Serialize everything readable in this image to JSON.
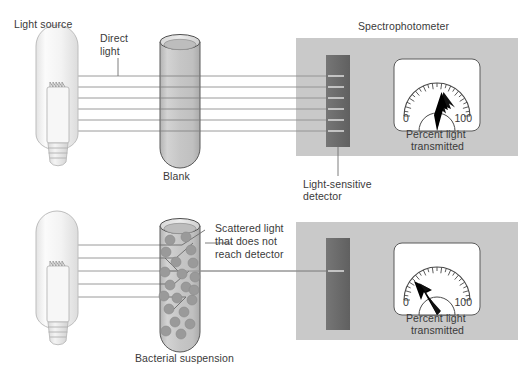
{
  "figure": {
    "title_absent": true,
    "background": "#ffffff",
    "panel_fill": "#c9c9c9",
    "detector_fill": "#6e6e6e",
    "meter_fill": "#ffffff",
    "tube_fill": "#c2c2c2",
    "bulb_fill": "#f2f2f2",
    "cell_fill": "#9a9a9a",
    "ray_color": "#8c8c8c",
    "outline_color": "#555555",
    "text_color": "#3a3a3a"
  },
  "labels": {
    "light_source": "Light source",
    "direct_light": "Direct\nlight",
    "direct_light_line1": "Direct",
    "direct_light_line2": "light",
    "blank": "Blank",
    "spectrophotometer": "Spectrophotometer",
    "light_sensitive_detector_line1": "Light-sensitive",
    "light_sensitive_detector_line2": "detector",
    "scattered_line1": "Scattered light",
    "scattered_line2": "that does not",
    "scattered_line3": "reach detector",
    "bacterial_suspension": "Bacterial suspension"
  },
  "meters": [
    {
      "id": "meter-top",
      "scale_min_label": "0",
      "scale_max_label": "100",
      "caption_line1": "Percent light",
      "caption_line2": "transmitted",
      "needle_reading_percent": 92,
      "needle_angle_deg": -52,
      "tick_count": 23
    },
    {
      "id": "meter-bottom",
      "scale_min_label": "0",
      "scale_max_label": "100",
      "caption_line1": "Percent light",
      "caption_line2": "transmitted",
      "needle_reading_percent": 22,
      "needle_angle_deg": -125,
      "tick_count": 23
    }
  ],
  "panels": [
    {
      "id": "panel-top",
      "name": "blank-measurement",
      "ray_count": 6,
      "rays_reaching_detector": 6,
      "tube_contents": "blank",
      "cell_count": 0
    },
    {
      "id": "panel-bottom",
      "name": "bacterial-suspension-measurement",
      "ray_count": 6,
      "rays_reaching_detector": 1,
      "tube_contents": "bacterial suspension",
      "cell_count": 21
    }
  ],
  "chart_data": {
    "type": "bar",
    "categories": [
      "Blank",
      "Bacterial suspension"
    ],
    "values": [
      92,
      22
    ],
    "ylabel": "Percent light transmitted",
    "xlabel": "",
    "ylim": [
      0,
      100
    ]
  }
}
